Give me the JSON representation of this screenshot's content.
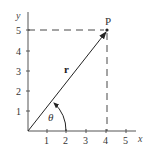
{
  "diagram": {
    "axes": {
      "x_label": "x",
      "y_label": "y",
      "x_ticks": [
        "1",
        "2",
        "3",
        "4",
        "5"
      ],
      "y_ticks": [
        "1",
        "2",
        "3",
        "4",
        "5"
      ]
    },
    "point": {
      "label": "P",
      "x": 4,
      "y": 5
    },
    "vector": {
      "label": "r",
      "from": [
        0,
        0
      ],
      "to": [
        4,
        5
      ]
    },
    "angle": {
      "label": "θ"
    },
    "guides": {
      "style": "dashed",
      "horizontal_at_y": 5,
      "vertical_at_x": 4
    },
    "colors": {
      "line": "#222222",
      "dash": "#333333",
      "text": "#333333"
    }
  }
}
